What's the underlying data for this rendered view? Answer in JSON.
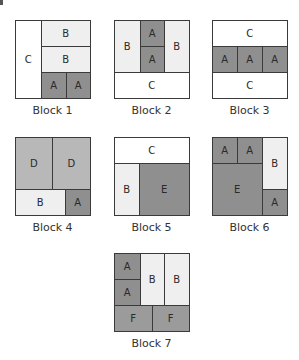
{
  "colors": {
    "A": "#8f8f8f",
    "B": "#efefef",
    "C": "#ffffff",
    "D": "#b8b8b8",
    "E": "#8f8f8f",
    "F": "#9b9b9b",
    "outline": "#3a3a3a"
  },
  "blocks": [
    {
      "caption": "Block 1",
      "x": 15,
      "y": 20,
      "pieces": [
        {
          "label": "C",
          "x": 0,
          "y": 0,
          "w": 26,
          "h": 78
        },
        {
          "label": "B",
          "x": 26,
          "y": 0,
          "w": 49,
          "h": 26
        },
        {
          "label": "B",
          "x": 26,
          "y": 26,
          "w": 49,
          "h": 26
        },
        {
          "label": "A",
          "x": 26,
          "y": 52,
          "w": 25,
          "h": 26
        },
        {
          "label": "A",
          "x": 51,
          "y": 52,
          "w": 24,
          "h": 26
        }
      ]
    },
    {
      "caption": "Block 2",
      "x": 114,
      "y": 20,
      "pieces": [
        {
          "label": "B",
          "x": 0,
          "y": 0,
          "w": 26,
          "h": 52
        },
        {
          "label": "A",
          "x": 26,
          "y": 0,
          "w": 24,
          "h": 26
        },
        {
          "label": "A",
          "x": 26,
          "y": 26,
          "w": 24,
          "h": 26
        },
        {
          "label": "B",
          "x": 50,
          "y": 0,
          "w": 25,
          "h": 52
        },
        {
          "label": "C",
          "x": 0,
          "y": 52,
          "w": 75,
          "h": 26
        }
      ]
    },
    {
      "caption": "Block 3",
      "x": 212,
      "y": 20,
      "pieces": [
        {
          "label": "C",
          "x": 0,
          "y": 0,
          "w": 75,
          "h": 26
        },
        {
          "label": "A",
          "x": 0,
          "y": 26,
          "w": 25,
          "h": 26
        },
        {
          "label": "A",
          "x": 25,
          "y": 26,
          "w": 25,
          "h": 26
        },
        {
          "label": "A",
          "x": 50,
          "y": 26,
          "w": 25,
          "h": 26
        },
        {
          "label": "C",
          "x": 0,
          "y": 52,
          "w": 75,
          "h": 26
        }
      ]
    },
    {
      "caption": "Block 4",
      "x": 15,
      "y": 137,
      "pieces": [
        {
          "label": "D",
          "x": 0,
          "y": 0,
          "w": 37,
          "h": 52
        },
        {
          "label": "D",
          "x": 37,
          "y": 0,
          "w": 38,
          "h": 52
        },
        {
          "label": "B",
          "x": 0,
          "y": 52,
          "w": 50,
          "h": 26
        },
        {
          "label": "A",
          "x": 50,
          "y": 52,
          "w": 25,
          "h": 26
        }
      ]
    },
    {
      "caption": "Block 5",
      "x": 114,
      "y": 137,
      "pieces": [
        {
          "label": "C",
          "x": 0,
          "y": 0,
          "w": 75,
          "h": 26
        },
        {
          "label": "B",
          "x": 0,
          "y": 26,
          "w": 25,
          "h": 52
        },
        {
          "label": "E",
          "x": 25,
          "y": 26,
          "w": 50,
          "h": 52
        }
      ]
    },
    {
      "caption": "Block 6",
      "x": 212,
      "y": 137,
      "pieces": [
        {
          "label": "A",
          "x": 0,
          "y": 0,
          "w": 25,
          "h": 26
        },
        {
          "label": "A",
          "x": 25,
          "y": 0,
          "w": 25,
          "h": 26
        },
        {
          "label": "E",
          "x": 0,
          "y": 26,
          "w": 50,
          "h": 52
        },
        {
          "label": "B",
          "x": 50,
          "y": 0,
          "w": 25,
          "h": 52
        },
        {
          "label": "A",
          "x": 50,
          "y": 52,
          "w": 25,
          "h": 26
        }
      ]
    },
    {
      "caption": "Block 7",
      "x": 114,
      "y": 253,
      "pieces": [
        {
          "label": "A",
          "x": 0,
          "y": 0,
          "w": 26,
          "h": 26
        },
        {
          "label": "A",
          "x": 0,
          "y": 26,
          "w": 26,
          "h": 26
        },
        {
          "label": "B",
          "x": 26,
          "y": 0,
          "w": 24,
          "h": 52
        },
        {
          "label": "B",
          "x": 50,
          "y": 0,
          "w": 25,
          "h": 52
        },
        {
          "label": "F",
          "x": 0,
          "y": 52,
          "w": 38,
          "h": 26
        },
        {
          "label": "F",
          "x": 38,
          "y": 52,
          "w": 37,
          "h": 26
        }
      ]
    }
  ]
}
